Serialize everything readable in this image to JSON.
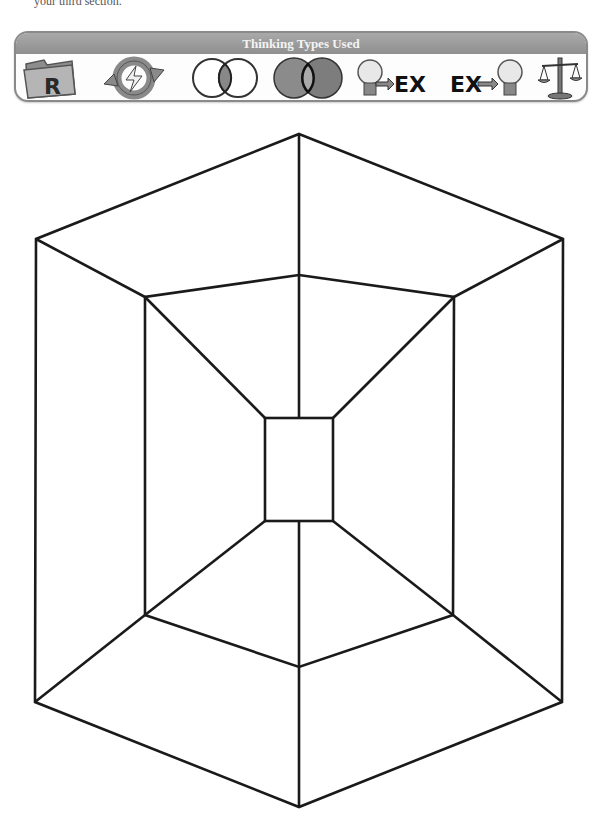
{
  "cutoff_text": "your third section.",
  "thinking_panel": {
    "title": "Thinking Types Used",
    "icons": [
      {
        "name": "folder-r-icon",
        "label": "R"
      },
      {
        "name": "cycle-arrows-icon"
      },
      {
        "name": "venn-overlap-icon"
      },
      {
        "name": "venn-shaded-icon"
      },
      {
        "name": "lightbulb-to-ex-icon",
        "label": "EX"
      },
      {
        "name": "ex-to-lightbulb-icon",
        "label": "EX"
      },
      {
        "name": "balance-scale-icon"
      }
    ]
  },
  "diagram": {
    "type": "nested-hexagon-frame",
    "stroke_color": "#1a1a1a",
    "outer_hexagon": [
      [
        299,
        134
      ],
      [
        563,
        239
      ],
      [
        562,
        702
      ],
      [
        299,
        807
      ],
      [
        35,
        702
      ],
      [
        36,
        239
      ]
    ],
    "middle_hexagon": [
      [
        299,
        275
      ],
      [
        454,
        297
      ],
      [
        453,
        615
      ],
      [
        299,
        667
      ],
      [
        145,
        615
      ],
      [
        145,
        297
      ]
    ],
    "inner_rectangle": {
      "x": 265,
      "y": 418,
      "width": 68,
      "height": 103
    }
  }
}
